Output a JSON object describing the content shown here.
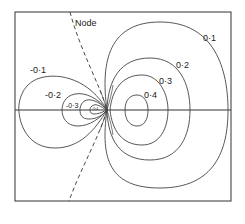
{
  "figure": {
    "type": "contour-plot",
    "node_label": "Node",
    "contours": {
      "positive": [
        "0·1",
        "0·2",
        "0·3",
        "0·4"
      ],
      "negative": [
        "-0·1",
        "-0·2",
        "-0·3",
        "-0·4"
      ]
    },
    "colors": {
      "line": "#333333",
      "background": "#ffffff"
    }
  }
}
